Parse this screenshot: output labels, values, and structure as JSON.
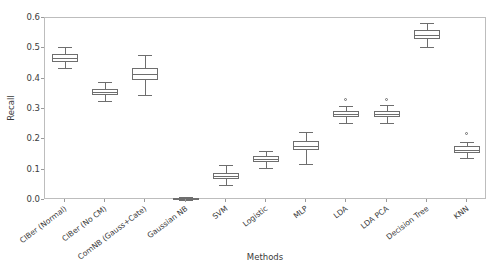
{
  "chart_data": {
    "type": "box",
    "title": "",
    "xlabel": "Methods",
    "ylabel": "Recall",
    "ylim": [
      0.0,
      0.6
    ],
    "yticks": [
      "0.0",
      "0.1",
      "0.2",
      "0.3",
      "0.4",
      "0.5",
      "0.6"
    ],
    "ytick_values": [
      0.0,
      0.1,
      0.2,
      0.3,
      0.4,
      0.5,
      0.6
    ],
    "grid": false,
    "legend": "none",
    "categories": [
      "CIBer (Normal)",
      "CIBer (No CM)",
      "ComNB (Gauss+Cate)",
      "Gaussian NB",
      "SVM",
      "Logistic",
      "MLP",
      "LDA",
      "LDA PCA",
      "Decision Tree",
      "KNN"
    ],
    "boxes": [
      {
        "label": "CIBer (Normal)",
        "whisker_low": 0.435,
        "q1": 0.455,
        "median": 0.468,
        "q3": 0.482,
        "whisker_high": 0.505,
        "fliers": []
      },
      {
        "label": "CIBer (No CM)",
        "whisker_low": 0.325,
        "q1": 0.345,
        "median": 0.355,
        "q3": 0.365,
        "whisker_high": 0.39,
        "fliers": []
      },
      {
        "label": "ComNB (Gauss+Cate)",
        "whisker_low": 0.345,
        "q1": 0.395,
        "median": 0.415,
        "q3": 0.435,
        "whisker_high": 0.477,
        "fliers": []
      },
      {
        "label": "Gaussian NB",
        "whisker_low": 0.0,
        "q1": 0.002,
        "median": 0.005,
        "q3": 0.008,
        "whisker_high": 0.01,
        "fliers": []
      },
      {
        "label": "SVM",
        "whisker_low": 0.05,
        "q1": 0.068,
        "median": 0.079,
        "q3": 0.09,
        "whisker_high": 0.115,
        "fliers": []
      },
      {
        "label": "Logistic",
        "whisker_low": 0.105,
        "q1": 0.125,
        "median": 0.134,
        "q3": 0.145,
        "whisker_high": 0.162,
        "fliers": []
      },
      {
        "label": "MLP",
        "whisker_low": 0.12,
        "q1": 0.165,
        "median": 0.178,
        "q3": 0.195,
        "whisker_high": 0.225,
        "fliers": []
      },
      {
        "label": "LDA",
        "whisker_low": 0.255,
        "q1": 0.272,
        "median": 0.282,
        "q3": 0.293,
        "whisker_high": 0.31,
        "fliers": [
          0.331
        ]
      },
      {
        "label": "LDA PCA",
        "whisker_low": 0.253,
        "q1": 0.272,
        "median": 0.283,
        "q3": 0.293,
        "whisker_high": 0.312,
        "fliers": [
          0.331
        ]
      },
      {
        "label": "Decision Tree",
        "whisker_low": 0.505,
        "q1": 0.53,
        "median": 0.545,
        "q3": 0.562,
        "whisker_high": 0.585,
        "fliers": []
      },
      {
        "label": "KNN",
        "whisker_low": 0.139,
        "q1": 0.155,
        "median": 0.164,
        "q3": 0.178,
        "whisker_high": 0.191,
        "fliers": [
          0.216
        ]
      }
    ],
    "colors": {
      "box_edge": "#6e6e6e",
      "box_face": "#ffffff",
      "axis": "#bdbdbd",
      "text": "#3b3b3b"
    }
  }
}
